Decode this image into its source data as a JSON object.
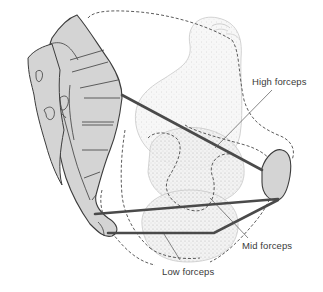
{
  "diagram": {
    "type": "anatomical-illustration",
    "labels": {
      "high": "High forceps",
      "mid": "Mid forceps",
      "low": "Low forceps"
    },
    "colors": {
      "bone_fill": "#d4d4d4",
      "outline": "#3c3c3c",
      "forceps_line": "#4a4a4a",
      "stipple": "#bdbdbd",
      "label_text": "#3a3a3a",
      "background": "#ffffff"
    }
  }
}
